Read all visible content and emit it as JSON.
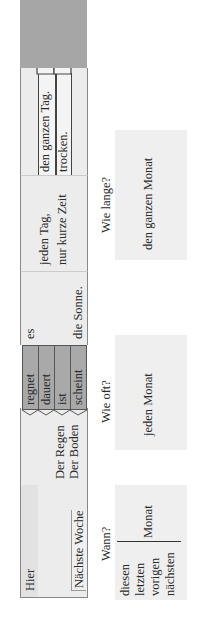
{
  "strip": {
    "place": {
      "top": "Hier",
      "bottom": "Nächste Woche"
    },
    "subjects": {
      "line1": "Der Regen",
      "line2": "Der Boden"
    },
    "verbs": [
      "regnet",
      "dauert",
      "ist",
      "scheint"
    ],
    "mid": {
      "top": "es",
      "bottom": "die Sonne."
    },
    "frequency": {
      "top": "jeden Tag,",
      "bottom": "nur kurze Zeit"
    },
    "tabs": [
      "den ganzen Tag.",
      "trocken."
    ]
  },
  "questions": {
    "wann": {
      "label": "Wann?",
      "options": [
        "diesen",
        "letzten",
        "vorigen",
        "nächsten"
      ],
      "noun": "Monat"
    },
    "wie_oft": {
      "label": "Wie oft?",
      "answer": "jeden Monat"
    },
    "wie_lange": {
      "label": "Wie lange?",
      "answer": "den ganzen Monat"
    }
  },
  "colors": {
    "strip_fill": "#ececec",
    "verb_fill": "#a9a9a9",
    "end_block_fill": "#a9a9a9",
    "question_box_fill": "#efefef"
  }
}
